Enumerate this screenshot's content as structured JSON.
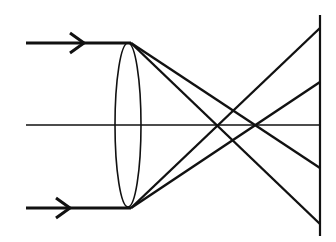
{
  "diagram": {
    "type": "optics-ray-diagram",
    "colors": {
      "stroke": "#111111",
      "background": "#ffffff"
    },
    "optical_axis": {
      "x1": 26,
      "x2": 320,
      "y": 125
    },
    "lens": {
      "cx": 128,
      "cy": 125,
      "rx": 13,
      "ry": 82
    },
    "screen": {
      "x": 320,
      "y1": 15,
      "y2": 236
    },
    "incident_rays": [
      {
        "x1": 26,
        "y1": 43,
        "x2": 131,
        "y2": 43,
        "arrow_x": 84
      },
      {
        "x1": 26,
        "y1": 208,
        "x2": 131,
        "y2": 208,
        "arrow_x": 70
      }
    ],
    "refracted_rays": [
      {
        "x1": 131,
        "y1": 43,
        "x2": 320,
        "y2": 224
      },
      {
        "x1": 131,
        "y1": 43,
        "x2": 320,
        "y2": 168
      },
      {
        "x1": 131,
        "y1": 208,
        "x2": 320,
        "y2": 28
      },
      {
        "x1": 131,
        "y1": 208,
        "x2": 320,
        "y2": 82
      }
    ]
  }
}
